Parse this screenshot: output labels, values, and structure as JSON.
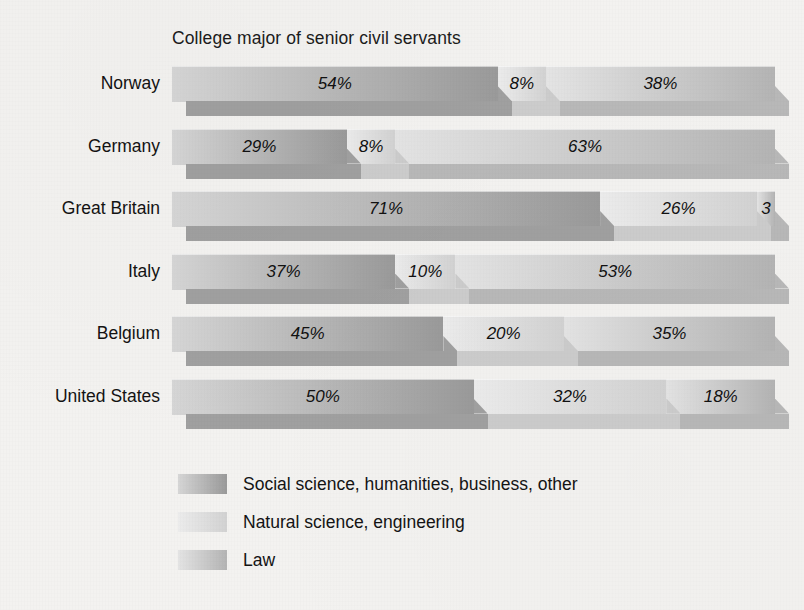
{
  "chart_data": {
    "type": "bar",
    "subtype": "stacked-horizontal-100pct-3d",
    "title": "College major of senior civil servants",
    "xlabel": "",
    "ylabel": "",
    "xlim": [
      0,
      100
    ],
    "grid": false,
    "legend_position": "bottom-left",
    "categories": [
      "Norway",
      "Germany",
      "Great Britain",
      "Italy",
      "Belgium",
      "United States"
    ],
    "series": [
      {
        "name": "Social science, humanities, business, other",
        "color": "#a7a7a7",
        "values": [
          54,
          29,
          71,
          37,
          45,
          50
        ],
        "labels": [
          "54%",
          "29%",
          "71%",
          "37%",
          "45%",
          "50%"
        ]
      },
      {
        "name": "Natural science, engineering",
        "color": "#dcdcdc",
        "values": [
          8,
          8,
          26,
          10,
          20,
          32
        ],
        "labels": [
          "8%",
          "8%",
          "26%",
          "10%",
          "20%",
          "32%"
        ]
      },
      {
        "name": "Law",
        "color": "#c4c4c4",
        "values": [
          38,
          63,
          3,
          53,
          35,
          18
        ],
        "labels": [
          "38%",
          "63%",
          "3",
          "53%",
          "35%",
          "18%"
        ]
      }
    ]
  },
  "legend": {
    "items": [
      {
        "label": "Social science, humanities, business, other",
        "swatch": "series-1-swatch"
      },
      {
        "label": "Natural science, engineering",
        "swatch": "series-2-swatch"
      },
      {
        "label": "Law",
        "swatch": "series-3-swatch"
      }
    ]
  },
  "colors": {
    "background": "#f3f2f0",
    "text": "#131313",
    "series_1_top_light": "#d6d6d6",
    "series_1_top_dark": "#9a9a9a",
    "series_1_front": "#a0a0a0",
    "series_2_top_light": "#ececec",
    "series_2_top_dark": "#d2d2d2",
    "series_2_front": "#cccccc",
    "series_3_top_light": "#e4e4e4",
    "series_3_top_dark": "#b4b4b4",
    "series_3_front": "#b8b8b8"
  }
}
